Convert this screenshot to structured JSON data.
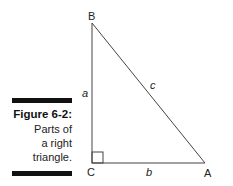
{
  "caption": {
    "title": "Figure 6-2:",
    "lines": [
      "Parts of",
      "a right",
      "triangle."
    ]
  },
  "figure": {
    "vertices": {
      "B": "B",
      "C": "C",
      "A": "A"
    },
    "sides": {
      "a": "a",
      "b": "b",
      "c": "c"
    },
    "right_angle_at": "C"
  }
}
